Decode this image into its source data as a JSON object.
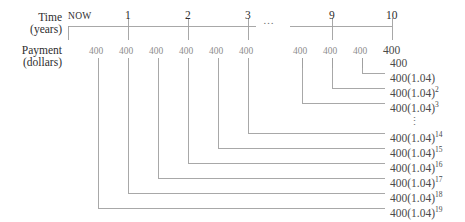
{
  "figure": {
    "type": "timeline-diagram",
    "line_color": "#9a9a9a",
    "text_color": "#3b3b3b",
    "background": "#ffffff"
  },
  "axes": {
    "time_label_line1": "Time",
    "time_label_line2": "(years)",
    "payment_label_line1": "Payment",
    "payment_label_line2": "(dollars)"
  },
  "timeline": {
    "now_label": "NOW",
    "ticks": [
      "1",
      "2",
      "3",
      "9",
      "10"
    ],
    "break_symbol": "…"
  },
  "payments": {
    "small_label": "400",
    "final_label": "400",
    "left_cluster_count": 6,
    "right_cluster_count": 3,
    "values": [
      "400",
      "400",
      "400",
      "400",
      "400",
      "400",
      "400",
      "400",
      "400",
      "400"
    ]
  },
  "terms": {
    "vertical_ellipsis": "⋮",
    "items": [
      {
        "base": "400",
        "suffix": "",
        "full": "400"
      },
      {
        "base": "400(1.04)",
        "suffix": "",
        "full": "400(1.04)"
      },
      {
        "base": "400(1.04)",
        "suffix": "2",
        "full": "400(1.04)2"
      },
      {
        "base": "400(1.04)",
        "suffix": "3",
        "full": "400(1.04)3"
      },
      {
        "base": "400(1.04)",
        "suffix": "14",
        "full": "400(1.04)14"
      },
      {
        "base": "400(1.04)",
        "suffix": "15",
        "full": "400(1.04)15"
      },
      {
        "base": "400(1.04)",
        "suffix": "16",
        "full": "400(1.04)16"
      },
      {
        "base": "400(1.04)",
        "suffix": "17",
        "full": "400(1.04)17"
      },
      {
        "base": "400(1.04)",
        "suffix": "18",
        "full": "400(1.04)18"
      },
      {
        "base": "400(1.04)",
        "suffix": "19",
        "full": "400(1.04)19"
      }
    ]
  }
}
